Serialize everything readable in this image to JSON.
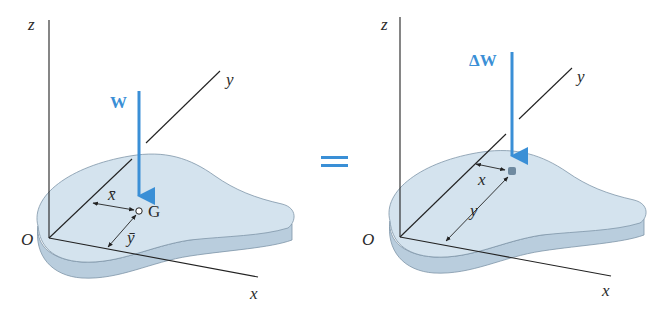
{
  "colors": {
    "force_arrow": "#3a8fd6",
    "plate_top": "#d4e3ee",
    "plate_edge": "#b7cbdc",
    "plate_outline": "#7f95a8",
    "axis_line": "#222222",
    "equals_sign": "#3a8fd6"
  },
  "left_figure": {
    "axes": {
      "z": "z",
      "y": "y",
      "x": "x",
      "origin": "O"
    },
    "force_label": "W",
    "point_label": "G",
    "dim_x_label": "x̄",
    "dim_y_label": "ȳ"
  },
  "equals": "=",
  "right_figure": {
    "axes": {
      "z": "z",
      "y": "y",
      "x": "x",
      "origin": "O"
    },
    "force_label": "ΔW",
    "dim_x_label": "x",
    "dim_y_label": "y"
  }
}
